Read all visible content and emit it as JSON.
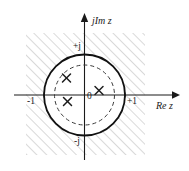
{
  "figure": {
    "kind": "complex-z-plane-pole-diagram",
    "background_color": "#ffffff",
    "line_color": "#1a1a1a",
    "hatch_color": "#b5b5b5",
    "axes": {
      "imaginary_axis_label": "jIm z",
      "real_axis_label": "Re z",
      "origin_label": "0",
      "ticks": [
        {
          "label": "-1",
          "axis": "real",
          "value": -1
        },
        {
          "label": "+1",
          "axis": "real",
          "value": 1
        },
        {
          "label": "+j",
          "axis": "imaginary",
          "value": 1
        },
        {
          "label": "-j",
          "axis": "imaginary",
          "value": -1
        }
      ]
    },
    "curves": [
      {
        "name": "unit-circle",
        "style": "solid",
        "radius_units": 1.0
      },
      {
        "name": "inner-radius-circle",
        "style": "dashed",
        "radius_units": 0.74
      }
    ],
    "markers": {
      "glyph": "x",
      "name": "pole-marker",
      "poles": [
        {
          "re": -0.45,
          "im": 0.42
        },
        {
          "re": -0.42,
          "im": -0.15
        },
        {
          "re": 0.35,
          "im": 0.07
        }
      ]
    },
    "hatched_region": {
      "name": "region-of-convergence-hatching",
      "description": "diagonal hatch fill",
      "angle_deg": 45
    }
  }
}
